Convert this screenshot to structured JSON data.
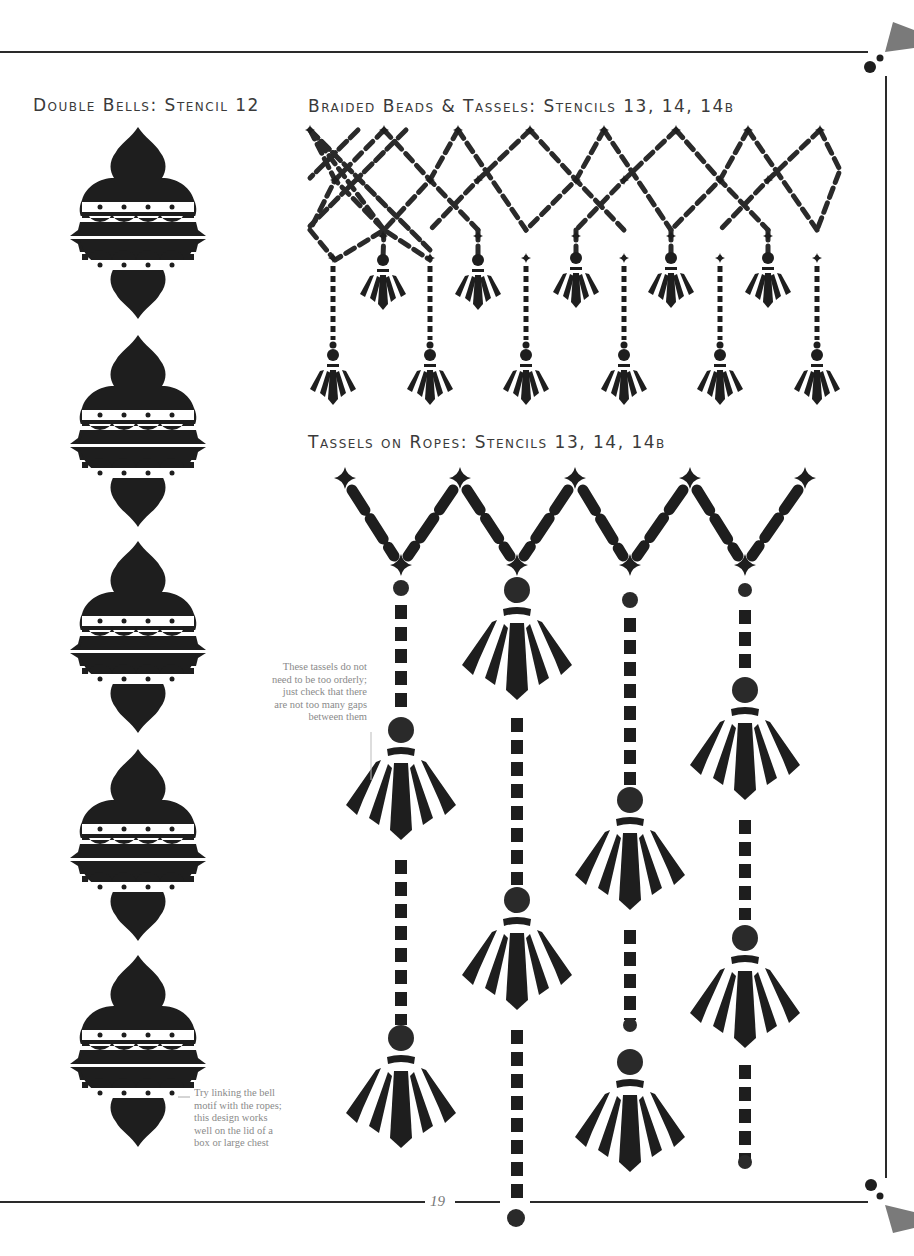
{
  "page": {
    "page_number": "19",
    "colors": {
      "ink": "#1e1e1e",
      "rule": "#2a2a2a",
      "ornament_gray": "#7a7a7a",
      "note_text": "#8a8a8a",
      "heading_text": "#3a3a3a"
    }
  },
  "sections": [
    {
      "id": "double-bells",
      "title": "Double Bells: Stencil 12",
      "motif_count": 5
    },
    {
      "id": "braided-beads",
      "title": "Braided Beads & Tassels: Stencils 13, 14, 14b",
      "short_tassels": 5,
      "long_tassels": 6
    },
    {
      "id": "tassels-on-ropes",
      "title": "Tassels on Ropes: Stencils 13, 14, 14b",
      "ropes": 4
    }
  ],
  "notes": [
    {
      "id": "ropes-note",
      "lines": [
        "These tassels do not",
        "need to be too orderly;",
        "just check that there",
        "are not too many gaps",
        "between them"
      ]
    },
    {
      "id": "bell-note",
      "lines": [
        "Try linking the bell",
        "motif with the ropes;",
        "this design works",
        "well on the lid of a",
        "box or large chest"
      ]
    }
  ]
}
